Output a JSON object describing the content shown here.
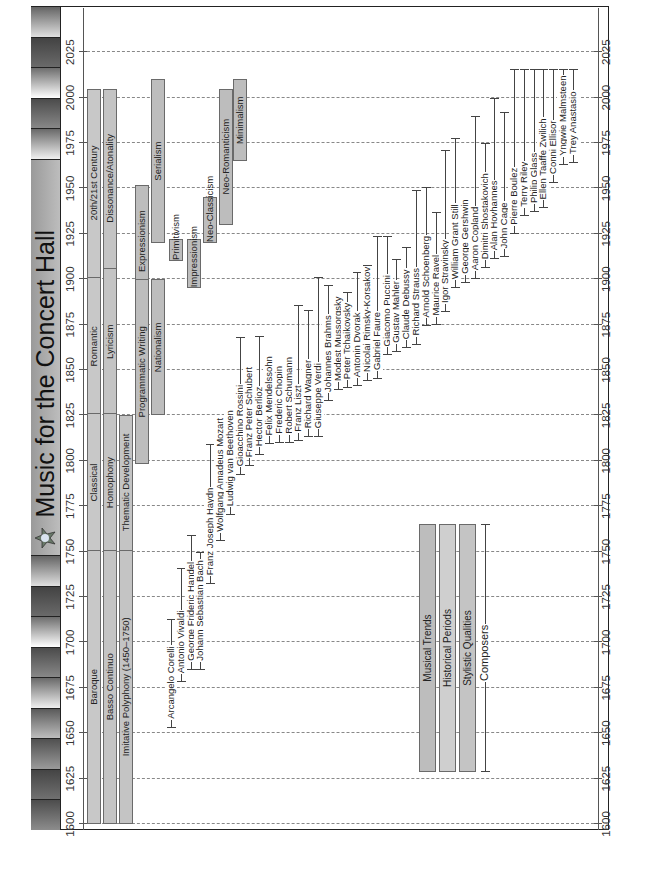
{
  "page": {
    "title": "Music for the Concert Hall",
    "orientation": "rotated-90-ccw"
  },
  "colors": {
    "bar_fill": "#c4c4c4",
    "bar_border": "#6a6a6a",
    "frame": "#222222",
    "title_bg": "#aaaaaa",
    "grid": "#888888"
  },
  "chart_data": {
    "type": "timeline",
    "title": "Music for the Concert Hall",
    "xlabel": "",
    "ylabel": "",
    "xlim": [
      1600,
      2025
    ],
    "x_ticks": [
      1600,
      1625,
      1650,
      1675,
      1700,
      1725,
      1750,
      1775,
      1800,
      1825,
      1850,
      1875,
      1900,
      1925,
      1950,
      1975,
      2000,
      2025
    ],
    "grid": true,
    "legend": {
      "position": "lower-left (rotated)",
      "entries": [
        "Musical Trends",
        "Historical Periods",
        "Stylistic Qualities",
        "Composers"
      ]
    },
    "historical_periods": [
      {
        "label": "Baroque",
        "start": 1600,
        "end": 1750
      },
      {
        "label": "Classical",
        "start": 1750,
        "end": 1825
      },
      {
        "label": "Romantic",
        "start": 1825,
        "end": 1900
      },
      {
        "label": "20th/21st Century",
        "start": 1900,
        "end": 2005
      }
    ],
    "stylistic_qualities": [
      {
        "label": "Basso Continuo",
        "start": 1600,
        "end": 1750
      },
      {
        "label": "Homophony",
        "start": 1750,
        "end": 1825
      },
      {
        "label": "Lyricism",
        "start": 1825,
        "end": 1905
      },
      {
        "label": "Dissonance/Atonality",
        "start": 1905,
        "end": 2005
      },
      {
        "label": "Imitative Polyphony (1450–1750)",
        "start": 1600,
        "end": 1750
      },
      {
        "label": "Thematic Development",
        "start": 1750,
        "end": 1825
      }
    ],
    "musical_trends": [
      {
        "label": "Expressionism",
        "start": 1890,
        "end": 1952
      },
      {
        "label": "Programmatic Writing",
        "start": 1798,
        "end": 1900
      },
      {
        "label": "Serialism",
        "start": 1920,
        "end": 2010
      },
      {
        "label": "Nationalism",
        "start": 1825,
        "end": 1900
      },
      {
        "label": "Primitivism",
        "start": 1910,
        "end": 1922
      },
      {
        "label": "Impressionism",
        "start": 1895,
        "end": 1922
      },
      {
        "label": "Neo-Classicism",
        "start": 1920,
        "end": 1945
      },
      {
        "label": "Neo-Romanticism",
        "start": 1930,
        "end": 2005
      },
      {
        "label": "Minimalism",
        "start": 1965,
        "end": 2010
      }
    ],
    "composers": [
      {
        "name": "Arcangelo Corelli",
        "start": 1653,
        "end": 1713
      },
      {
        "name": "Antonio Vivaldi",
        "start": 1678,
        "end": 1741
      },
      {
        "name": "George Frideric Handel",
        "start": 1685,
        "end": 1759
      },
      {
        "name": "Johann Sebastian Bach",
        "start": 1685,
        "end": 1750
      },
      {
        "name": "Franz Joseph Haydn",
        "start": 1732,
        "end": 1809
      },
      {
        "name": "Wolfgang Amadeus Mozart",
        "start": 1756,
        "end": 1791
      },
      {
        "name": "Ludwig van Beethoven",
        "start": 1770,
        "end": 1827
      },
      {
        "name": "Gioacchino Rossini",
        "start": 1792,
        "end": 1868
      },
      {
        "name": "Franz Peter Schubert",
        "start": 1797,
        "end": 1828
      },
      {
        "name": "Hector Berlioz",
        "start": 1803,
        "end": 1869
      },
      {
        "name": "Felix Mendelssohn",
        "start": 1809,
        "end": 1847
      },
      {
        "name": "Frederic Chopin",
        "start": 1810,
        "end": 1849
      },
      {
        "name": "Robert Schumann",
        "start": 1810,
        "end": 1856
      },
      {
        "name": "Franz Liszt",
        "start": 1811,
        "end": 1886
      },
      {
        "name": "Richard Wagner",
        "start": 1813,
        "end": 1883
      },
      {
        "name": "Giuseppe Verdi",
        "start": 1813,
        "end": 1901
      },
      {
        "name": "Johannes Brahms",
        "start": 1833,
        "end": 1897
      },
      {
        "name": "Modest Mussorgsky",
        "start": 1839,
        "end": 1881
      },
      {
        "name": "Peter Tchaikovsky",
        "start": 1840,
        "end": 1893
      },
      {
        "name": "Antonin Dvorak",
        "start": 1841,
        "end": 1904
      },
      {
        "name": "Nicolai Rimsky-Korsakov",
        "start": 1844,
        "end": 1908
      },
      {
        "name": "Gabriel Faure",
        "start": 1845,
        "end": 1924
      },
      {
        "name": "Giacomo Puccini",
        "start": 1858,
        "end": 1924
      },
      {
        "name": "Gustav Mahler",
        "start": 1860,
        "end": 1911
      },
      {
        "name": "Claude Debussy",
        "start": 1862,
        "end": 1918
      },
      {
        "name": "Richard Strauss",
        "start": 1864,
        "end": 1949
      },
      {
        "name": "Arnold Schoenberg",
        "start": 1874,
        "end": 1951
      },
      {
        "name": "Maurice Ravel",
        "start": 1875,
        "end": 1937
      },
      {
        "name": "Igor Stravinsky",
        "start": 1882,
        "end": 1971
      },
      {
        "name": "William Grant Still",
        "start": 1895,
        "end": 1978
      },
      {
        "name": "George Gershwin",
        "start": 1898,
        "end": 1937
      },
      {
        "name": "Aaron Copland",
        "start": 1900,
        "end": 1990
      },
      {
        "name": "Dimitri Shostakovich",
        "start": 1906,
        "end": 1975
      },
      {
        "name": "Alan Hovhannes",
        "start": 1911,
        "end": 2000
      },
      {
        "name": "John Cage",
        "start": 1912,
        "end": 1992
      },
      {
        "name": "Pierre Boulez",
        "start": 1925,
        "end": 2016
      },
      {
        "name": "Terry Riley",
        "start": 1935,
        "end": 2016
      },
      {
        "name": "Philip Glass",
        "start": 1937,
        "end": 2016
      },
      {
        "name": "Ellen Taaffe Zwilich",
        "start": 1939,
        "end": 2016
      },
      {
        "name": "Conni Ellisor",
        "start": 1953,
        "end": 2016
      },
      {
        "name": "Yngwie Malmsteen",
        "start": 1963,
        "end": 2016
      },
      {
        "name": "Trey Anastasio",
        "start": 1964,
        "end": 2016
      }
    ]
  },
  "legend": {
    "musical_trends": "Musical Trends",
    "historical_periods": "Historical Periods",
    "stylistic_qualities": "Stylistic Qualities",
    "composers": "Composers"
  },
  "banner": {
    "tiles": [
      "#8c8c8c",
      "#707070",
      "#9a9a9a",
      "#bdbdbd",
      "#f0f0f0",
      "#888888",
      "#ffffff",
      "#6a6a6a",
      "#e0e0e0",
      "#f4f4f4",
      "#444444",
      "#9a9a9a",
      "#707070",
      "#444444",
      "#ffffff",
      "#d8d8d8",
      "#707070",
      "#e6e6e6"
    ],
    "logo_icon": "composer-star-icon"
  }
}
